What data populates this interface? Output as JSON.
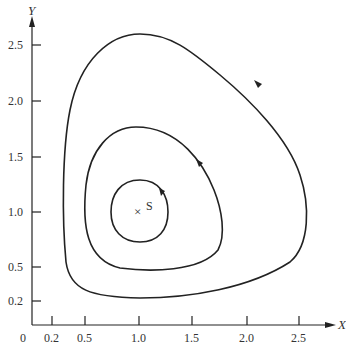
{
  "figure": {
    "type": "phase-portrait",
    "x_axis": {
      "label": "X",
      "ticks": [
        "0.2",
        "0.5",
        "1.0",
        "1.5",
        "2.0",
        "2.5"
      ],
      "origin": "0"
    },
    "y_axis": {
      "label": "Y",
      "ticks": [
        "2.5",
        "2.0",
        "1.5",
        "1.0",
        "0.5",
        "0.2"
      ]
    },
    "equilibrium": {
      "label": "S",
      "marker": "×",
      "x": 1.0,
      "y": 1.0
    },
    "orbits": [
      {
        "name": "inner",
        "xmin": 0.72,
        "xmax": 1.3,
        "ymin": 0.73,
        "ymax": 1.3,
        "direction": "counterclockwise"
      },
      {
        "name": "middle",
        "xmin": 0.45,
        "xmax": 1.8,
        "ymin": 0.5,
        "ymax": 1.77,
        "direction": "counterclockwise"
      },
      {
        "name": "outer",
        "xmin": 0.26,
        "xmax": 2.68,
        "ymin": 0.25,
        "ymax": 2.6,
        "direction": "counterclockwise"
      }
    ],
    "colors": {
      "line": "#222222",
      "background": "#ffffff"
    }
  }
}
